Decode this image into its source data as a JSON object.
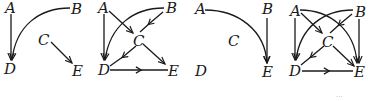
{
  "diagrams": [
    {
      "id": "graph-1",
      "nodes": {
        "A": "A",
        "B": "B",
        "C": "C",
        "D": "D",
        "E": "E"
      },
      "edges": [
        {
          "from": "A",
          "to": "D",
          "shape": "straight"
        },
        {
          "from": "B",
          "to": "D",
          "shape": "curve"
        },
        {
          "from": "C",
          "to": "E",
          "shape": "straight"
        }
      ]
    },
    {
      "id": "graph-2",
      "nodes": {
        "A": "A",
        "B": "B",
        "C": "C",
        "D": "D",
        "E": "E"
      },
      "edges": [
        {
          "from": "A",
          "to": "D",
          "shape": "straight"
        },
        {
          "from": "A",
          "to": "C",
          "shape": "straight"
        },
        {
          "from": "B",
          "to": "C",
          "shape": "straight"
        },
        {
          "from": "B",
          "to": "D",
          "shape": "curve"
        },
        {
          "from": "C",
          "to": "D",
          "shape": "straight"
        },
        {
          "from": "C",
          "to": "E",
          "shape": "straight"
        },
        {
          "from": "D",
          "to": "E",
          "shape": "straight"
        }
      ]
    },
    {
      "id": "graph-3",
      "nodes": {
        "A": "A",
        "B": "B",
        "C": "C",
        "D": "D",
        "E": "E"
      },
      "edges": [
        {
          "from": "A",
          "to": "E",
          "shape": "curve"
        },
        {
          "from": "B",
          "to": "E",
          "shape": "straight"
        }
      ]
    },
    {
      "id": "graph-4",
      "nodes": {
        "A": "A",
        "B": "B",
        "C": "C",
        "D": "D",
        "E": "E"
      },
      "edges": [
        {
          "from": "A",
          "to": "D",
          "shape": "straight"
        },
        {
          "from": "A",
          "to": "C",
          "shape": "straight"
        },
        {
          "from": "A",
          "to": "E",
          "shape": "curve"
        },
        {
          "from": "B",
          "to": "C",
          "shape": "straight"
        },
        {
          "from": "B",
          "to": "D",
          "shape": "curve"
        },
        {
          "from": "B",
          "to": "E",
          "shape": "straight"
        },
        {
          "from": "C",
          "to": "D",
          "shape": "straight"
        },
        {
          "from": "C",
          "to": "E",
          "shape": "straight"
        },
        {
          "from": "D",
          "to": "E",
          "shape": "straight"
        }
      ]
    }
  ],
  "footer": {
    "page_mark": "···"
  }
}
